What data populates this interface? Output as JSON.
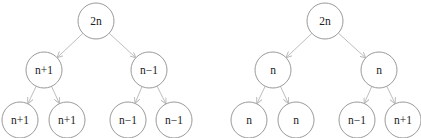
{
  "style": {
    "node_stroke": "#9a9a9a",
    "edge_stroke": "#b5b5b5",
    "text_color": "#222222",
    "node_radius": 18
  },
  "trees": [
    {
      "name": "left-tree",
      "nodes": [
        {
          "id": "L0",
          "label": "2n",
          "x": 96,
          "y": 21
        },
        {
          "id": "L1",
          "label": "n+1",
          "x": 44,
          "y": 70
        },
        {
          "id": "L2",
          "label": "n−1",
          "x": 149,
          "y": 70
        },
        {
          "id": "L3",
          "label": "n+1",
          "x": 20,
          "y": 120
        },
        {
          "id": "L4",
          "label": "n+1",
          "x": 67,
          "y": 120
        },
        {
          "id": "L5",
          "label": "n−1",
          "x": 128,
          "y": 120
        },
        {
          "id": "L6",
          "label": "n−1",
          "x": 174,
          "y": 120
        }
      ],
      "edges": [
        [
          "L0",
          "L1"
        ],
        [
          "L0",
          "L2"
        ],
        [
          "L1",
          "L3"
        ],
        [
          "L1",
          "L4"
        ],
        [
          "L2",
          "L5"
        ],
        [
          "L2",
          "L6"
        ]
      ]
    },
    {
      "name": "right-tree",
      "nodes": [
        {
          "id": "R0",
          "label": "2n",
          "x": 325,
          "y": 21
        },
        {
          "id": "R1",
          "label": "n",
          "x": 273,
          "y": 70
        },
        {
          "id": "R2",
          "label": "n",
          "x": 379,
          "y": 70
        },
        {
          "id": "R3",
          "label": "n",
          "x": 249,
          "y": 120
        },
        {
          "id": "R4",
          "label": "n",
          "x": 296,
          "y": 120
        },
        {
          "id": "R5",
          "label": "n−1",
          "x": 357,
          "y": 120
        },
        {
          "id": "R6",
          "label": "n+1",
          "x": 403,
          "y": 120
        }
      ],
      "edges": [
        [
          "R0",
          "R1"
        ],
        [
          "R0",
          "R2"
        ],
        [
          "R1",
          "R3"
        ],
        [
          "R1",
          "R4"
        ],
        [
          "R2",
          "R5"
        ],
        [
          "R2",
          "R6"
        ]
      ]
    }
  ]
}
